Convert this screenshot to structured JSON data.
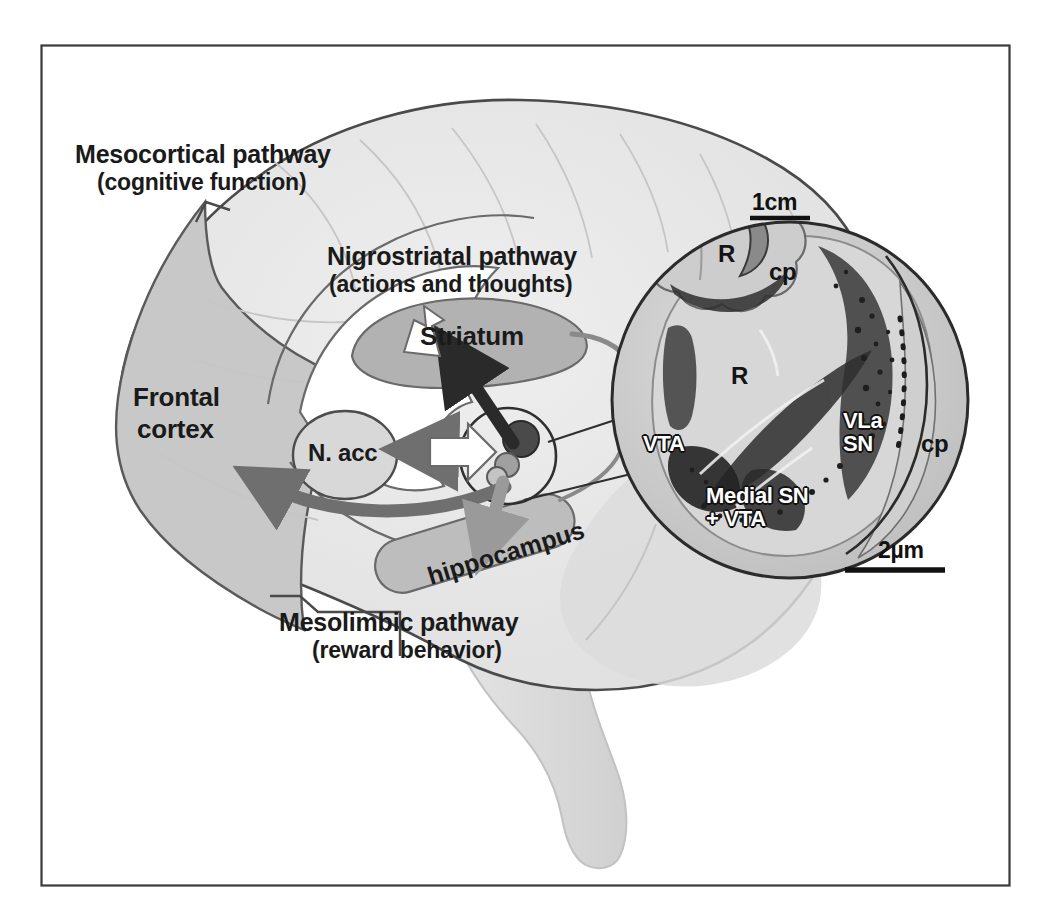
{
  "figure": {
    "kind": "brain-dopamine-pathways-diagram",
    "border_color": "#3a3a3a",
    "background": "#ffffff"
  },
  "colors": {
    "brain_fill": "#e8e8e8",
    "brain_outline": "#4a4a4a",
    "frontal_cortex_fill": "#c8c8c8",
    "striatum_fill": "#b2b2b2",
    "hippocampus_fill": "#bdbdbd",
    "nacc_fill": "#d8d8d8",
    "arrow_dark": "#2a2a2a",
    "arrow_mid": "#777777",
    "arrow_light": "#9a9a9a",
    "inset_outline": "#2b2b2b",
    "text": "#1a1a1a"
  },
  "pathways": [
    {
      "id": "mesocortical",
      "title": "Mesocortical pathway",
      "subtitle": "(cognitive function)",
      "x": 75,
      "y": 140
    },
    {
      "id": "nigrostriatal",
      "title": "Nigrostriatal pathway",
      "subtitle": "(actions and thoughts)",
      "x": 327,
      "y": 242
    },
    {
      "id": "mesolimbic",
      "title": "Mesolimbic pathway",
      "subtitle": "(reward behavior)",
      "x": 279,
      "y": 608
    }
  ],
  "brain_regions": [
    {
      "id": "frontal-cortex",
      "label_line1": "Frontal",
      "label_line2": "cortex",
      "x": 133,
      "y": 383
    },
    {
      "id": "striatum",
      "label": "Striatum",
      "x": 420,
      "y": 322
    },
    {
      "id": "nucleus-accumbens",
      "label": "N. acc",
      "x": 325,
      "y": 440
    },
    {
      "id": "hippocampus",
      "label": "hippocampus",
      "x": 424,
      "y": 563,
      "rotation_deg": -17
    }
  ],
  "inset": {
    "scalebar_top": "1cm",
    "scalebar_bottom": "2µm",
    "labels": [
      {
        "id": "thumb-R",
        "text": "R",
        "style": "dark",
        "x": 718,
        "y": 241
      },
      {
        "id": "thumb-cp",
        "text": "cp",
        "style": "dark",
        "x": 769,
        "y": 259
      },
      {
        "id": "main-R",
        "text": "R",
        "style": "dark",
        "x": 731,
        "y": 363
      },
      {
        "id": "vta",
        "text": "VTA",
        "style": "white",
        "x": 643,
        "y": 432
      },
      {
        "id": "vla-sn",
        "text": "VLa\nSN",
        "style": "white",
        "x": 843,
        "y": 409
      },
      {
        "id": "cp-right",
        "text": "cp",
        "style": "dark",
        "x": 921,
        "y": 431
      },
      {
        "id": "medial-sn",
        "text": "Medial SN\n+ VTA",
        "style": "white",
        "x": 706,
        "y": 484
      }
    ]
  }
}
